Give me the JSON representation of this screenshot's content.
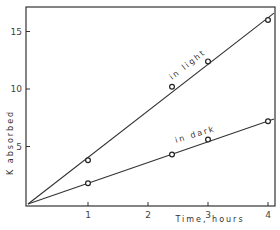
{
  "chart_data": {
    "type": "line",
    "title": "",
    "xlabel": "Time, hours",
    "ylabel": "K absorbed",
    "xlim": [
      0,
      4.1
    ],
    "ylim": [
      0,
      17
    ],
    "x_ticks": [
      "1",
      "2",
      "3",
      "4"
    ],
    "y_ticks": [
      "5",
      "10",
      "15"
    ],
    "grid": false,
    "legend": "none (inline line labels)",
    "series": [
      {
        "name": "in light",
        "x": [
          1,
          2.4,
          3.0,
          4.0
        ],
        "values": [
          3.8,
          10.2,
          12.4,
          16.0
        ],
        "fit_line": [
          [
            0,
            0
          ],
          [
            4.1,
            16.6
          ]
        ]
      },
      {
        "name": "in dark",
        "x": [
          1,
          2.4,
          3.0,
          4.0
        ],
        "values": [
          1.8,
          4.3,
          5.6,
          7.2
        ],
        "fit_line": [
          [
            0,
            0
          ],
          [
            4.1,
            7.4
          ]
        ]
      }
    ]
  }
}
